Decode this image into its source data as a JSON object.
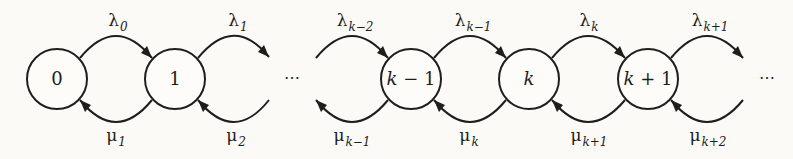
{
  "diagram": {
    "colors": {
      "background": "#fbfaf6",
      "stroke": "#1e1e1e"
    },
    "nodes": [
      {
        "id": "0",
        "label": "0",
        "cx": 57,
        "cy": 79
      },
      {
        "id": "1",
        "label": "1",
        "cx": 175,
        "cy": 79
      },
      {
        "id": "k-1",
        "label_var": "k",
        "label_rest": " − 1",
        "cx": 411,
        "cy": 79
      },
      {
        "id": "k",
        "label_var": "k",
        "label_rest": "",
        "cx": 529,
        "cy": 79
      },
      {
        "id": "k+1",
        "label_var": "k",
        "label_rest": " + 1",
        "cx": 648,
        "cy": 79
      }
    ],
    "ellipsis": [
      "⋯",
      "⋯"
    ],
    "forward_rates": [
      {
        "sym": "λ",
        "sub": "0",
        "from": "0",
        "to": "1"
      },
      {
        "sym": "λ",
        "sub": "1",
        "from": "1",
        "to": "…"
      },
      {
        "sym": "λ",
        "sub": "k−2",
        "from": "…",
        "to": "k-1"
      },
      {
        "sym": "λ",
        "sub": "k−1",
        "from": "k-1",
        "to": "k"
      },
      {
        "sym": "λ",
        "sub": "k",
        "from": "k",
        "to": "k+1"
      },
      {
        "sym": "λ",
        "sub": "k+1",
        "from": "k+1",
        "to": "…"
      }
    ],
    "backward_rates": [
      {
        "sym": "μ",
        "sub": "1",
        "from": "1",
        "to": "0"
      },
      {
        "sym": "μ",
        "sub": "2",
        "from": "…",
        "to": "1"
      },
      {
        "sym": "μ",
        "sub": "k−1",
        "from": "k-1",
        "to": "…"
      },
      {
        "sym": "μ",
        "sub": "k",
        "from": "k",
        "to": "k-1"
      },
      {
        "sym": "μ",
        "sub": "k+1",
        "from": "k+1",
        "to": "k"
      },
      {
        "sym": "μ",
        "sub": "k+2",
        "from": "…",
        "to": "k+1"
      }
    ]
  }
}
